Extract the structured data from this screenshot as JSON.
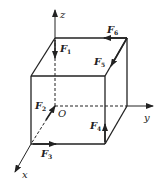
{
  "diagram": {
    "colors": {
      "stroke": "#222222",
      "background": "#ffffff"
    },
    "origin_label": "O",
    "axes": [
      {
        "name": "z",
        "label": "z"
      },
      {
        "name": "y",
        "label": "y"
      },
      {
        "name": "x",
        "label": "x"
      }
    ],
    "forces": [
      {
        "id": "F1",
        "base": "F",
        "sub": "1",
        "edge": "back-left vertical, pointing down"
      },
      {
        "id": "F2",
        "base": "F",
        "sub": "2",
        "edge": "bottom-left depth edge, pointing toward O"
      },
      {
        "id": "F3",
        "base": "F",
        "sub": "3",
        "edge": "front bottom edge, pointing +y"
      },
      {
        "id": "F4",
        "base": "F",
        "sub": "4",
        "edge": "front-right vertical, pointing up"
      },
      {
        "id": "F5",
        "base": "F",
        "sub": "5",
        "edge": "top-right depth edge, pointing toward front"
      },
      {
        "id": "F6",
        "base": "F",
        "sub": "6",
        "edge": "top back edge, pointing -y"
      }
    ]
  }
}
